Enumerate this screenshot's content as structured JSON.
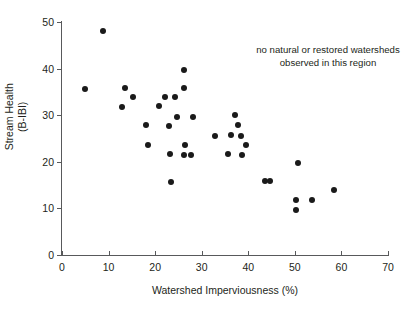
{
  "chart_data": {
    "type": "scatter",
    "title": "",
    "xlabel": "Watershed Imperviousness (%)",
    "ylabel_line1": "Stream Health",
    "ylabel_line2": "(B-IBI)",
    "xlim": [
      0,
      70
    ],
    "ylim": [
      0,
      50
    ],
    "xticks": [
      0,
      10,
      20,
      30,
      40,
      50,
      60,
      70
    ],
    "yticks": [
      0,
      10,
      20,
      30,
      40,
      50
    ],
    "grid": false,
    "legend": null,
    "marker_color": "#1a1a1a",
    "axis_color": "#58595b",
    "annotations": [
      {
        "text": "no natural or restored watersheds observed in this region",
        "x": 52,
        "y": 44
      }
    ],
    "points": [
      {
        "x": 8.7,
        "y": 48.0
      },
      {
        "x": 5.0,
        "y": 35.7
      },
      {
        "x": 13.5,
        "y": 35.9
      },
      {
        "x": 15.3,
        "y": 34.0
      },
      {
        "x": 12.8,
        "y": 31.8
      },
      {
        "x": 18.0,
        "y": 27.8
      },
      {
        "x": 18.4,
        "y": 23.5
      },
      {
        "x": 20.9,
        "y": 31.9
      },
      {
        "x": 22.2,
        "y": 33.9
      },
      {
        "x": 22.9,
        "y": 27.7
      },
      {
        "x": 23.2,
        "y": 21.7
      },
      {
        "x": 23.5,
        "y": 15.7
      },
      {
        "x": 24.3,
        "y": 33.9
      },
      {
        "x": 24.6,
        "y": 29.7
      },
      {
        "x": 26.2,
        "y": 39.8
      },
      {
        "x": 26.3,
        "y": 35.9
      },
      {
        "x": 26.4,
        "y": 23.5
      },
      {
        "x": 26.3,
        "y": 21.5
      },
      {
        "x": 27.8,
        "y": 21.5
      },
      {
        "x": 28.2,
        "y": 29.7
      },
      {
        "x": 32.8,
        "y": 25.6
      },
      {
        "x": 35.7,
        "y": 21.7
      },
      {
        "x": 36.2,
        "y": 25.8
      },
      {
        "x": 37.2,
        "y": 30.0
      },
      {
        "x": 37.7,
        "y": 27.8
      },
      {
        "x": 38.4,
        "y": 25.5
      },
      {
        "x": 38.6,
        "y": 21.5
      },
      {
        "x": 39.6,
        "y": 23.7
      },
      {
        "x": 43.5,
        "y": 15.8
      },
      {
        "x": 44.7,
        "y": 15.8
      },
      {
        "x": 50.6,
        "y": 19.8
      },
      {
        "x": 50.3,
        "y": 11.8
      },
      {
        "x": 50.3,
        "y": 9.7
      },
      {
        "x": 53.7,
        "y": 11.7
      },
      {
        "x": 58.5,
        "y": 13.9
      }
    ]
  }
}
